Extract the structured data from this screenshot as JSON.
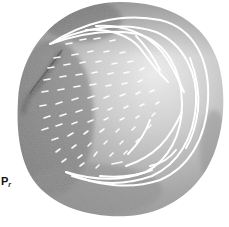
{
  "figure": {
    "panel_label": "P",
    "panel_label_subscript": "r",
    "colors": {
      "background": "#ffffff",
      "disc_dark": "#6f6f6f",
      "disc_mid": "#a6a6a6",
      "disc_light": "#e4e4e4",
      "stain_dark": "#3c3c3c",
      "lines": "#ffffff",
      "label": "#111111"
    }
  }
}
